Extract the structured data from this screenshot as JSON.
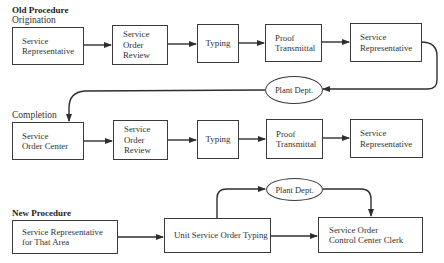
{
  "old_procedure": {
    "title": "Old Procedure",
    "origination": {
      "label": "Origination",
      "steps": [
        {
          "text": "Service\nRepresentative"
        },
        {
          "text": "Service\nOrder\nReview"
        },
        {
          "text": "Typing"
        },
        {
          "text": "Proof\nTransmittal"
        },
        {
          "text": "Service\nRepresentative"
        }
      ]
    },
    "handoff": {
      "text": "Plant Dept."
    },
    "completion": {
      "label": "Completion",
      "steps": [
        {
          "text": "Service\nOrder Center"
        },
        {
          "text": "Service\nOrder\nReview"
        },
        {
          "text": "Typing"
        },
        {
          "text": "Proof\nTransmittal"
        },
        {
          "text": "Service\nRepresentative"
        }
      ]
    }
  },
  "new_procedure": {
    "title": "New Procedure",
    "steps": [
      {
        "text": "Service Representative\nfor That Area"
      },
      {
        "text": "Unit Service Order Typing"
      },
      {
        "text": "Service Order\nControl Center Clerk"
      }
    ],
    "branch": {
      "text": "Plant Dept."
    }
  },
  "colors": {
    "line": "#2e2e2e",
    "text": "#333333",
    "background": "#ffffff"
  }
}
